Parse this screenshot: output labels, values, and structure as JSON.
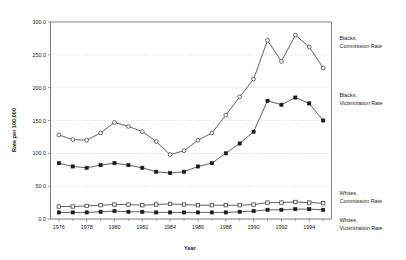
{
  "chart_data": {
    "type": "line",
    "title": "",
    "xlabel": "Year",
    "ylabel": "Rate per 100,000",
    "x": [
      1976,
      1977,
      1978,
      1979,
      1980,
      1981,
      1982,
      1983,
      1984,
      1985,
      1986,
      1987,
      1988,
      1989,
      1990,
      1991,
      1992,
      1993,
      1994,
      1995
    ],
    "xlim": [
      1975.4,
      1995.6
    ],
    "ylim": [
      0,
      300
    ],
    "xticks": [
      1976,
      1978,
      1980,
      1982,
      1984,
      1986,
      1988,
      1990,
      1992,
      1994
    ],
    "xtick_labels": [
      "1976",
      "1978",
      "1980",
      "1982",
      "1984",
      "1986",
      "1988",
      "1990",
      "1992",
      "1994"
    ],
    "yticks": [
      0,
      50,
      100,
      150,
      200,
      250,
      300
    ],
    "ytick_labels": [
      "0.0",
      "50.0",
      "100.0",
      "150.0",
      "200.0",
      "250.0",
      "300.0"
    ],
    "grid": "horizontal-dotted",
    "legend_position": "right-inline-labels",
    "series": [
      {
        "name": "Blacks, Commission Rate",
        "label_lines": [
          "Blacks,",
          "Commission Rate"
        ],
        "marker": "open-circle",
        "values": [
          128,
          121,
          120,
          131,
          147,
          141,
          133,
          118,
          98,
          104,
          120,
          131,
          158,
          186,
          213,
          272,
          240,
          280,
          262,
          230
        ]
      },
      {
        "name": "Blacks, Victimization Rate",
        "label_lines": [
          "Blacks,",
          "Victimization Rate"
        ],
        "marker": "filled-square",
        "values": [
          85,
          80,
          78,
          82,
          85,
          82,
          78,
          72,
          70,
          72,
          80,
          85,
          100,
          115,
          133,
          180,
          174,
          185,
          176,
          150
        ]
      },
      {
        "name": "Whites, Commission Rate",
        "label_lines": [
          "Whites,",
          "Commission Rate"
        ],
        "marker": "open-square",
        "values": [
          19,
          19,
          20,
          21,
          22,
          22,
          21,
          22,
          23,
          22,
          21,
          21,
          21,
          21,
          22,
          25,
          25,
          26,
          25,
          24
        ]
      },
      {
        "name": "Whites, Victimization Rate",
        "label_lines": [
          "Whites,",
          "Victimization Rate"
        ],
        "marker": "filled-square",
        "values": [
          10,
          10,
          10,
          11,
          12,
          11,
          11,
          10,
          10,
          10,
          10,
          10,
          10,
          11,
          12,
          14,
          14,
          15,
          15,
          14
        ]
      }
    ]
  },
  "colors": {
    "line": "#2b2b2b",
    "grid": "#b9b9b9",
    "axis": "#6e6e6e",
    "text": "#1a1a1a",
    "background": "#ffffff"
  }
}
